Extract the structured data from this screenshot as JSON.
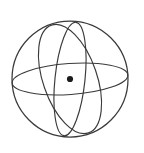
{
  "figure": {
    "kind": "geometry-diagram",
    "background_color": "#ffffff",
    "stroke_color": "#3a3a3a",
    "dot_color": "#1c1c1c",
    "canvas": {
      "width": 144,
      "height": 153
    },
    "sphere": {
      "name": "sphere-outline",
      "center_x": 70,
      "center_y": 79,
      "radius": 58,
      "stroke_width": 1.25
    },
    "center_point": {
      "name": "center-point",
      "x": 70,
      "y": 79,
      "radius": 3.1,
      "label": ""
    },
    "great_circles": [
      {
        "name": "equator-ellipse",
        "description": "near-horizontal equatorial great circle",
        "rx": 58,
        "ry": 15.5,
        "rotation_deg": -4,
        "stroke_width": 1.15
      },
      {
        "name": "tilted-ellipse",
        "description": "great circle tilted from lower-left to upper-right",
        "rx": 57,
        "ry": 27,
        "rotation_deg": 71,
        "stroke_width": 1.15
      },
      {
        "name": "meridian-ellipse",
        "description": "narrow near-vertical meridian great circle",
        "rx": 57,
        "ry": 15,
        "rotation_deg": 96,
        "stroke_width": 1.15
      }
    ],
    "labels": []
  }
}
